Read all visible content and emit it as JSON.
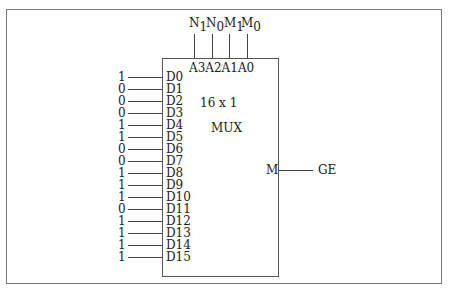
{
  "diagram": {
    "type": "multiplexer",
    "title_line1": "16  x  1",
    "title_line2": "MUX",
    "select_pins": [
      "A3",
      "A2",
      "A1",
      "A0"
    ],
    "select_signals": [
      {
        "main": "N",
        "sub": "1"
      },
      {
        "main": "N",
        "sub": "0"
      },
      {
        "main": "M",
        "sub": "1"
      },
      {
        "main": "M",
        "sub": "0"
      }
    ],
    "select_header": "A3A2A1A0",
    "inputs": [
      {
        "pin": "D0",
        "value": "1"
      },
      {
        "pin": "D1",
        "value": "0"
      },
      {
        "pin": "D2",
        "value": "0"
      },
      {
        "pin": "D3",
        "value": "0"
      },
      {
        "pin": "D4",
        "value": "1"
      },
      {
        "pin": "D5",
        "value": "1"
      },
      {
        "pin": "D6",
        "value": "0"
      },
      {
        "pin": "D7",
        "value": "0"
      },
      {
        "pin": "D8",
        "value": "1"
      },
      {
        "pin": "D9",
        "value": "1"
      },
      {
        "pin": "D10",
        "value": "1"
      },
      {
        "pin": "D11",
        "value": "0"
      },
      {
        "pin": "D12",
        "value": "1"
      },
      {
        "pin": "D13",
        "value": "1"
      },
      {
        "pin": "D14",
        "value": "1"
      },
      {
        "pin": "D15",
        "value": "1"
      }
    ],
    "output": {
      "pin": "M",
      "signal": "GE"
    }
  }
}
